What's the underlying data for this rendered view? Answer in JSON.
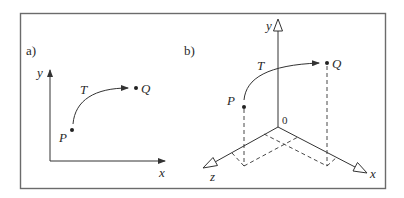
{
  "figure": {
    "frame_color": "#6b6b6b",
    "line_color": "#333333",
    "panel_a": {
      "label": "a)",
      "axis_x_label": "x",
      "axis_y_label": "y",
      "point_start": "P",
      "point_end": "Q",
      "transform_label": "T"
    },
    "panel_b": {
      "label": "b)",
      "axis_x_label": "x",
      "axis_y_label": "y",
      "axis_z_label": "z",
      "origin_label": "0",
      "point_start": "P",
      "point_end": "Q",
      "transform_label": "T"
    }
  }
}
